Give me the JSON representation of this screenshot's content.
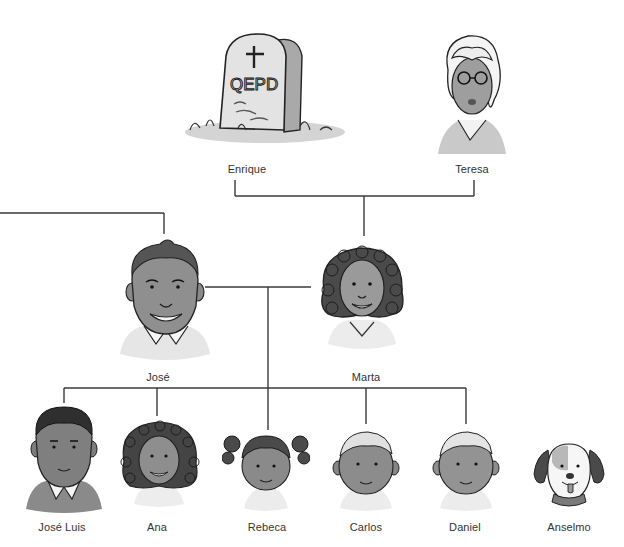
{
  "diagram": {
    "type": "family-tree",
    "line_color": "#3a3a3a",
    "text_color": "#333333",
    "background": "#ffffff"
  },
  "generations": {
    "grandparents": [
      {
        "id": "enrique",
        "name": "Enrique",
        "portrait": "tombstone-icon",
        "tombstone_text": "QEPD",
        "deceased": true
      },
      {
        "id": "teresa",
        "name": "Teresa",
        "portrait": "woman-glasses-portrait"
      }
    ],
    "parents": [
      {
        "id": "jose",
        "name": "José",
        "portrait": "man-portrait"
      },
      {
        "id": "marta",
        "name": "Marta",
        "portrait": "woman-curly-hair-portrait"
      }
    ],
    "children": [
      {
        "id": "jose-luis",
        "name": "José Luis",
        "portrait": "young-man-portrait"
      },
      {
        "id": "ana",
        "name": "Ana",
        "portrait": "girl-curly-hair-portrait"
      },
      {
        "id": "rebeca",
        "name": "Rebeca",
        "portrait": "girl-pigtails-portrait"
      },
      {
        "id": "carlos",
        "name": "Carlos",
        "portrait": "boy-portrait"
      },
      {
        "id": "daniel",
        "name": "Daniel",
        "portrait": "boy-portrait"
      },
      {
        "id": "anselmo",
        "name": "Anselmo",
        "portrait": "dog-portrait",
        "pet": true
      }
    ]
  }
}
